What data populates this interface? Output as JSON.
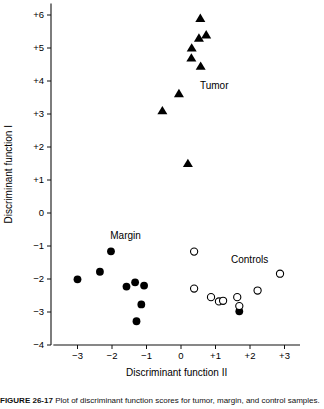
{
  "figure": {
    "caption_bold": "FIGURE 26-17",
    "caption_rest": "Plot of discriminant function scores for tumor, margin, and control samples.",
    "caption_visible_fragment": "FIGURE 26-17  Plot of discriminant function scores"
  },
  "chart_data": {
    "type": "scatter",
    "title": "",
    "xlabel": "Discriminant function II",
    "ylabel": "Discriminant function I",
    "xlim": [
      -3.7,
      3.45
    ],
    "ylim": [
      -4,
      6.35
    ],
    "xticks": [
      -3,
      -2,
      -1,
      0,
      1,
      2,
      3
    ],
    "xtick_labels": [
      "−3",
      "−2",
      "−1",
      "0",
      "+1",
      "+2",
      "+3"
    ],
    "yticks": [
      -4,
      -3,
      -2,
      -1,
      0,
      1,
      2,
      3,
      4,
      5,
      6
    ],
    "ytick_labels": [
      "−4",
      "−3",
      "−2",
      "−1",
      "0",
      "+1",
      "+2",
      "+3",
      "+4",
      "+5",
      "+6"
    ],
    "grid": false,
    "legend": "inline-annotations",
    "annotations": [
      {
        "text": "Tumor",
        "x": 0.55,
        "y": 3.75
      },
      {
        "text": "Margin",
        "x": -2.05,
        "y": -0.78
      },
      {
        "text": "Controls",
        "x": 1.45,
        "y": -1.5
      }
    ],
    "series": [
      {
        "name": "Tumor",
        "marker": "filled-triangle",
        "color": "#000000",
        "points": [
          {
            "x": 0.56,
            "y": 5.9
          },
          {
            "x": 0.52,
            "y": 5.3
          },
          {
            "x": 0.73,
            "y": 5.4
          },
          {
            "x": 0.31,
            "y": 5.0
          },
          {
            "x": 0.3,
            "y": 4.7
          },
          {
            "x": 0.57,
            "y": 4.45
          },
          {
            "x": -0.06,
            "y": 3.62
          },
          {
            "x": -0.54,
            "y": 3.1
          },
          {
            "x": 0.2,
            "y": 1.5
          }
        ]
      },
      {
        "name": "Margin",
        "marker": "filled-circle",
        "color": "#000000",
        "points": [
          {
            "x": -2.03,
            "y": -1.16
          },
          {
            "x": -2.35,
            "y": -1.78
          },
          {
            "x": -3.0,
            "y": -2.01
          },
          {
            "x": -1.58,
            "y": -2.23
          },
          {
            "x": -1.33,
            "y": -2.1
          },
          {
            "x": -1.07,
            "y": -2.2
          },
          {
            "x": -1.15,
            "y": -2.77
          },
          {
            "x": -1.29,
            "y": -3.28
          },
          {
            "x": 1.69,
            "y": -2.98
          }
        ]
      },
      {
        "name": "Controls",
        "marker": "open-circle",
        "color": "#000000",
        "points": [
          {
            "x": 0.38,
            "y": -1.17
          },
          {
            "x": 2.87,
            "y": -1.84
          },
          {
            "x": 0.38,
            "y": -2.29
          },
          {
            "x": 0.87,
            "y": -2.55
          },
          {
            "x": 1.1,
            "y": -2.68
          },
          {
            "x": 1.22,
            "y": -2.66
          },
          {
            "x": 2.22,
            "y": -2.35
          },
          {
            "x": 1.63,
            "y": -2.55
          },
          {
            "x": 1.69,
            "y": -2.82
          }
        ]
      }
    ]
  }
}
